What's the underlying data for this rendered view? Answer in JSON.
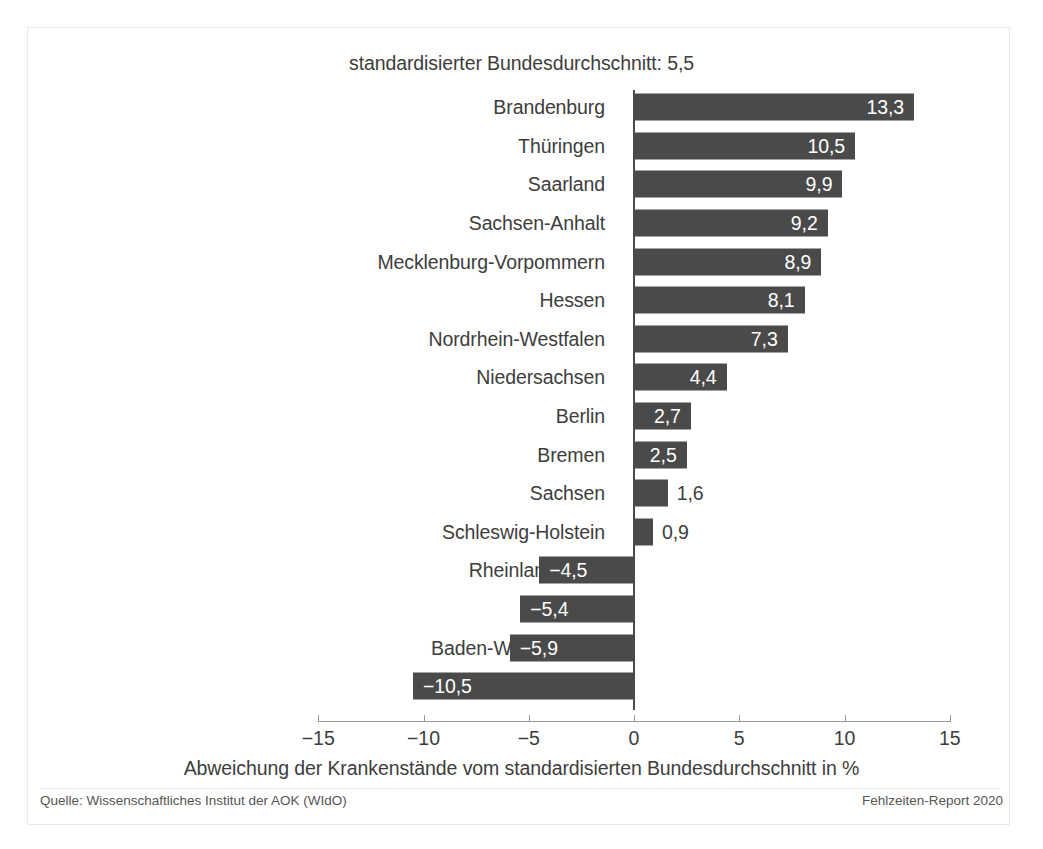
{
  "chart_data": {
    "type": "bar",
    "orientation": "horizontal",
    "title": "standardisierter Bundesdurchschnitt: 5,5",
    "xlabel": "Abweichung der Krankenstände vom standardisierten Bundesdurchschnitt in %",
    "ylabel": "",
    "xlim": [
      -15,
      15
    ],
    "xticks": [
      -15,
      -10,
      -5,
      0,
      5,
      10,
      15
    ],
    "xtick_labels": [
      "−15",
      "−10",
      "−5",
      "0",
      "5",
      "10",
      "15"
    ],
    "grid": false,
    "legend": null,
    "bar_color": "#4a4a4a",
    "categories": [
      "Brandenburg",
      "Thüringen",
      "Saarland",
      "Sachsen-Anhalt",
      "Mecklenburg-Vorpommern",
      "Hessen",
      "Nordrhein-Westfalen",
      "Niedersachsen",
      "Berlin",
      "Bremen",
      "Sachsen",
      "Schleswig-Holstein",
      "Rheinland-Pfalz",
      "Hamburg",
      "Baden-Württemberg",
      "Bayern"
    ],
    "values": [
      13.3,
      10.5,
      9.9,
      9.2,
      8.9,
      8.1,
      7.3,
      4.4,
      2.7,
      2.5,
      1.6,
      0.9,
      -4.5,
      -5.4,
      -5.9,
      -10.5
    ],
    "value_labels": [
      "13,3",
      "10,5",
      "9,9",
      "9,2",
      "8,9",
      "8,1",
      "7,3",
      "4,4",
      "2,7",
      "2,5",
      "1,6",
      "0,9",
      "−4,5",
      "−5,4",
      "−5,9",
      "−10,5"
    ]
  },
  "footer": {
    "source": "Quelle: Wissenschaftliches Institut der AOK (WIdO)",
    "report": "Fehlzeiten-Report 2020"
  }
}
